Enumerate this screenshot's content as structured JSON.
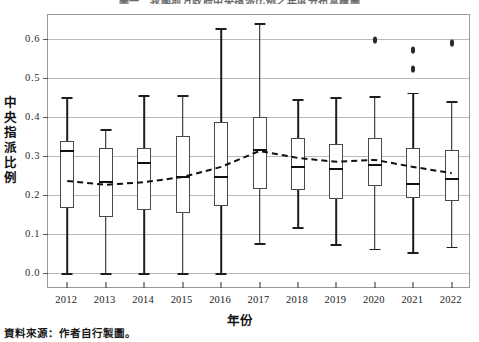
{
  "chart_data": {
    "type": "box",
    "title": "圖一　我國地方政府中央指派比例之年度分布盒鬚圖",
    "xlabel": "年份",
    "ylabel": "中央指派比例",
    "ylim": [
      0.0,
      0.65
    ],
    "ytick_labels": [
      "0.0",
      "0.1",
      "0.2",
      "0.3",
      "0.4",
      "0.5",
      "0.6"
    ],
    "ytick_values": [
      0.0,
      0.1,
      0.2,
      0.3,
      0.4,
      0.5,
      0.6
    ],
    "grid": "horizontal",
    "legend": "none",
    "categories": [
      "2012",
      "2013",
      "2014",
      "2015",
      "2016",
      "2017",
      "2018",
      "2019",
      "2020",
      "2021",
      "2022"
    ],
    "boxes": [
      {
        "year": "2012",
        "whisker_low": 0.0,
        "q1": 0.167,
        "median": 0.315,
        "q3": 0.338,
        "whisker_high": 0.451,
        "outliers": []
      },
      {
        "year": "2013",
        "whisker_low": 0.0,
        "q1": 0.144,
        "median": 0.236,
        "q3": 0.321,
        "whisker_high": 0.369,
        "outliers": []
      },
      {
        "year": "2014",
        "whisker_low": 0.0,
        "q1": 0.162,
        "median": 0.285,
        "q3": 0.321,
        "whisker_high": 0.456,
        "outliers": []
      },
      {
        "year": "2015",
        "whisker_low": 0.0,
        "q1": 0.154,
        "median": 0.249,
        "q3": 0.351,
        "whisker_high": 0.456,
        "outliers": []
      },
      {
        "year": "2016",
        "whisker_low": 0.0,
        "q1": 0.172,
        "median": 0.249,
        "q3": 0.387,
        "whisker_high": 0.628,
        "outliers": []
      },
      {
        "year": "2017",
        "whisker_low": 0.077,
        "q1": 0.215,
        "median": 0.318,
        "q3": 0.4,
        "whisker_high": 0.641,
        "outliers": []
      },
      {
        "year": "2018",
        "whisker_low": 0.118,
        "q1": 0.213,
        "median": 0.274,
        "q3": 0.346,
        "whisker_high": 0.446,
        "outliers": []
      },
      {
        "year": "2019",
        "whisker_low": 0.074,
        "q1": 0.19,
        "median": 0.269,
        "q3": 0.331,
        "whisker_high": 0.451,
        "outliers": []
      },
      {
        "year": "2020",
        "whisker_low": 0.062,
        "q1": 0.223,
        "median": 0.279,
        "q3": 0.346,
        "whisker_high": 0.454,
        "outliers": [
          0.597
        ]
      },
      {
        "year": "2021",
        "whisker_low": 0.054,
        "q1": 0.192,
        "median": 0.231,
        "q3": 0.32,
        "whisker_high": 0.462,
        "outliers": [
          0.572,
          0.523
        ]
      },
      {
        "year": "2022",
        "whisker_low": 0.067,
        "q1": 0.185,
        "median": 0.244,
        "q3": 0.315,
        "whisker_high": 0.441,
        "outliers": [
          0.59
        ]
      }
    ],
    "mean_series": {
      "name": "平均數",
      "style": "dashed",
      "values": [
        0.236,
        0.226,
        0.233,
        0.246,
        0.272,
        0.313,
        0.295,
        0.285,
        0.29,
        0.272,
        0.256
      ]
    }
  },
  "footer": {
    "source_note": "資料來源：作者自行製圖。"
  }
}
